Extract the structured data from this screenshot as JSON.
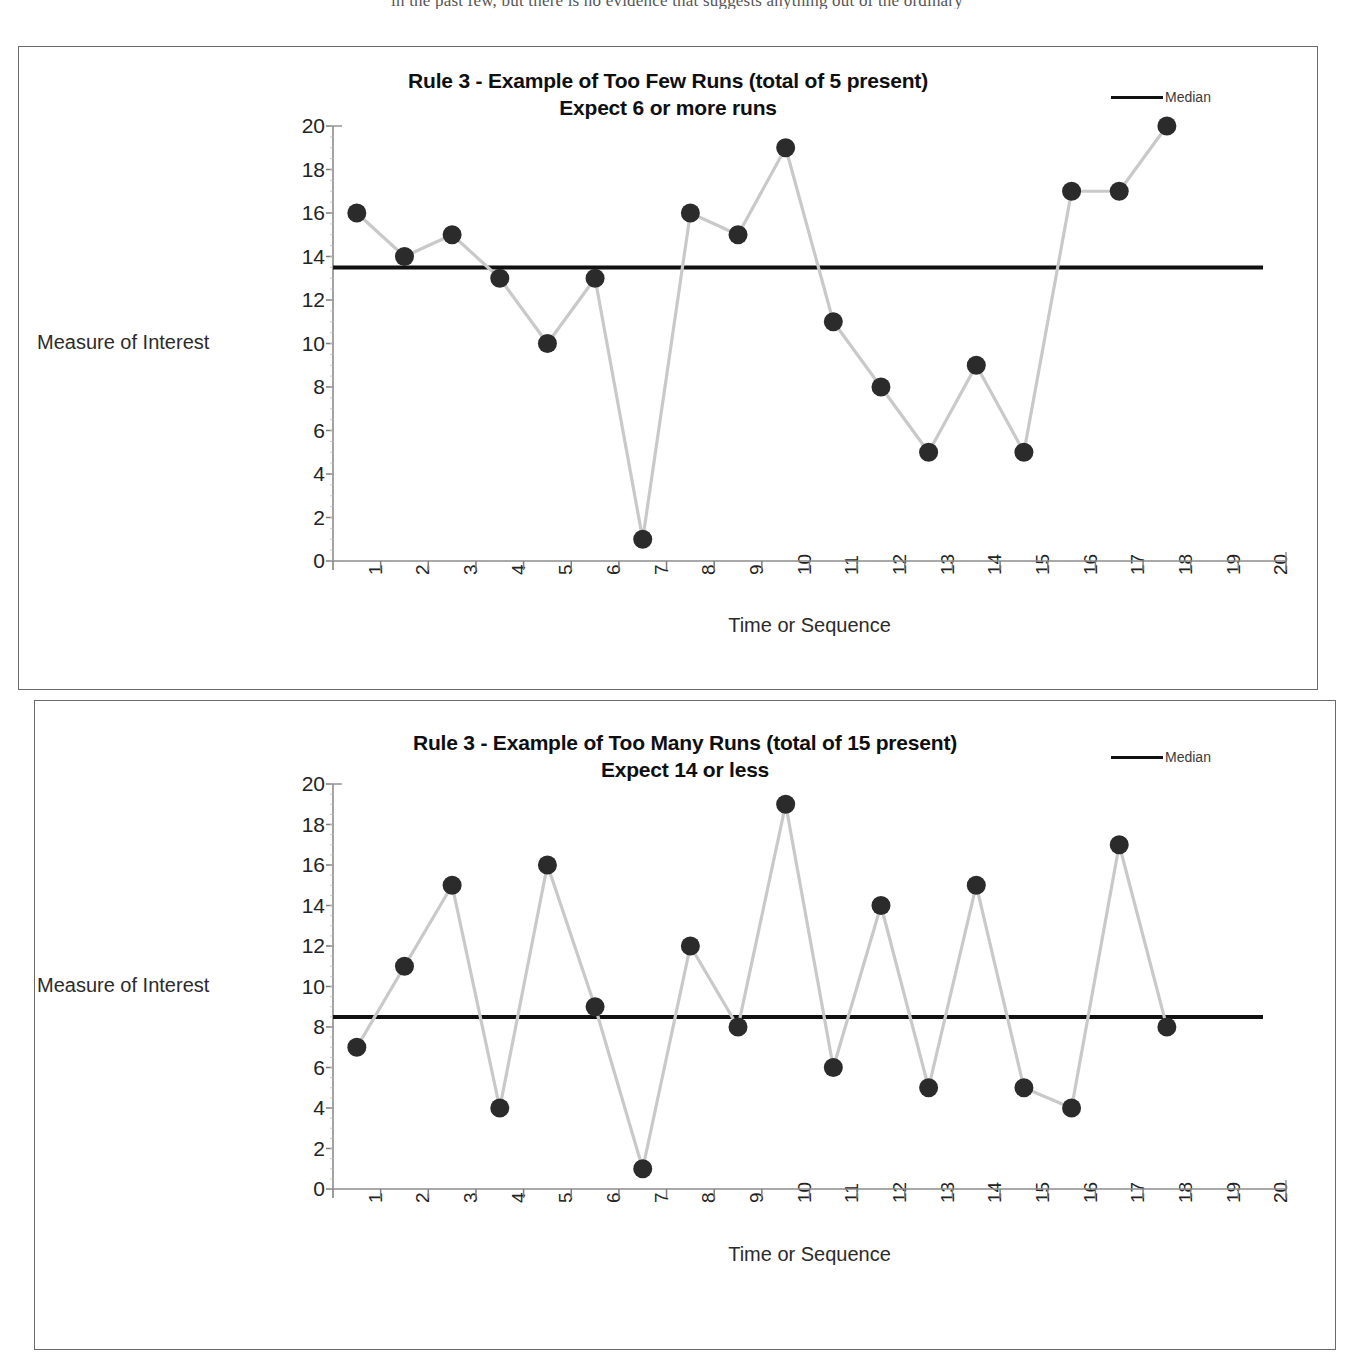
{
  "document": {
    "clipped_top_line": "in the past few, but there is no evidence that suggests anything out of the ordinary"
  },
  "charts": [
    {
      "id": "chart-too-few-runs",
      "title_line1": "Rule 3 - Example of Too Few Runs (total of 5 present)",
      "title_line2": "Expect 6 or more runs",
      "legend_label": "Median",
      "y_axis_title": "Measure of Interest",
      "x_axis_title": "Time or Sequence"
    },
    {
      "id": "chart-too-many-runs",
      "title_line1": "Rule 3 - Example of Too Many Runs (total of 15 present)",
      "title_line2": "Expect 14 or less",
      "legend_label": "Median",
      "y_axis_title": "Measure of Interest",
      "x_axis_title": "Time or Sequence"
    }
  ],
  "chart_data": [
    {
      "type": "line",
      "title": "Rule 3 - Example of Too Few Runs (total of 5 present) Expect 6 or more runs",
      "xlabel": "Time or Sequence",
      "ylabel": "Measure of Interest",
      "x": [
        1,
        2,
        3,
        4,
        5,
        6,
        7,
        8,
        9,
        10,
        11,
        12,
        13,
        14,
        15,
        16,
        17,
        18,
        19,
        20
      ],
      "xtick_labels": [
        "1",
        "2",
        "3",
        "4",
        "5",
        "6",
        "7",
        "8",
        "9",
        "10",
        "11",
        "12",
        "13",
        "14",
        "15",
        "16",
        "17",
        "18",
        "19",
        "20"
      ],
      "ytick_labels": [
        "0",
        "2",
        "4",
        "6",
        "8",
        "10",
        "12",
        "14",
        "16",
        "18",
        "20"
      ],
      "ylim": [
        0,
        20
      ],
      "ytick_step": 2,
      "grid": false,
      "legend": [
        "Median"
      ],
      "legend_position": "top-right",
      "series": [
        {
          "name": "Measure of Interest",
          "values": [
            16,
            14,
            15,
            13,
            10,
            13,
            1,
            16,
            15,
            19,
            11,
            8,
            5,
            9,
            5,
            17,
            17,
            20,
            null,
            null
          ],
          "marker": "filled-circle",
          "marker_color": "#2b2b2b",
          "line_color": "#c9c9c9"
        },
        {
          "name": "Median",
          "type": "hline",
          "value": 13.5,
          "color": "#111111"
        }
      ],
      "annotations": {
        "runs_total": 5,
        "runs_expected": "6 or more"
      }
    },
    {
      "type": "line",
      "title": "Rule 3 - Example of Too Many Runs (total of 15 present) Expect 14 or less",
      "xlabel": "Time or Sequence",
      "ylabel": "Measure of Interest",
      "x": [
        1,
        2,
        3,
        4,
        5,
        6,
        7,
        8,
        9,
        10,
        11,
        12,
        13,
        14,
        15,
        16,
        17,
        18,
        19,
        20
      ],
      "xtick_labels": [
        "1",
        "2",
        "3",
        "4",
        "5",
        "6",
        "7",
        "8",
        "9",
        "10",
        "11",
        "12",
        "13",
        "14",
        "15",
        "16",
        "17",
        "18",
        "19",
        "20"
      ],
      "ytick_labels": [
        "0",
        "2",
        "4",
        "6",
        "8",
        "10",
        "12",
        "14",
        "16",
        "18",
        "20"
      ],
      "ylim": [
        0,
        20
      ],
      "ytick_step": 2,
      "grid": false,
      "legend": [
        "Median"
      ],
      "legend_position": "top-right",
      "series": [
        {
          "name": "Measure of Interest",
          "values": [
            7,
            11,
            15,
            4,
            16,
            9,
            1,
            12,
            8,
            19,
            6,
            14,
            5,
            15,
            5,
            4,
            17,
            8,
            null,
            null
          ],
          "marker": "filled-circle",
          "marker_color": "#2b2b2b",
          "line_color": "#c9c9c9"
        },
        {
          "name": "Median",
          "type": "hline",
          "value": 8.5,
          "color": "#111111"
        }
      ],
      "annotations": {
        "runs_total": 15,
        "runs_expected": "14 or less"
      }
    }
  ]
}
